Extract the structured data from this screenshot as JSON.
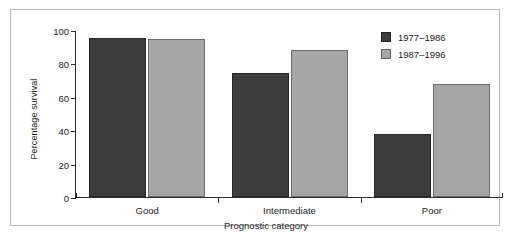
{
  "chart_data": {
    "type": "bar",
    "title": "",
    "subtitle": "",
    "xlabel": "Prognostic category",
    "ylabel": "Percentage survival",
    "categories": [
      "Good",
      "Intermediate",
      "Poor"
    ],
    "series": [
      {
        "name": "1977–1986",
        "color": "#3d3d3d",
        "values": [
          95.5,
          74.5,
          38
        ]
      },
      {
        "name": "1987–1996",
        "color": "#a6a6a6",
        "values": [
          94.5,
          88,
          67.5
        ]
      }
    ],
    "ylim": [
      0,
      100
    ],
    "yticks": [
      0,
      20,
      40,
      60,
      80,
      100
    ],
    "ytick_labels": [
      "0",
      "20",
      "40",
      "60",
      "80",
      "100"
    ],
    "grid": false,
    "legend_position": "top-right",
    "annotations": []
  },
  "legend": {
    "entries": [
      {
        "label": "1977–1986",
        "color": "#3d3d3d"
      },
      {
        "label": "1987–1996",
        "color": "#a6a6a6"
      }
    ]
  },
  "colors": {
    "series_dark": "#3d3d3d",
    "series_light": "#a6a6a6",
    "axis": "#2c2c2c",
    "frame": "#b9b9b9",
    "background": "#ffffff"
  }
}
